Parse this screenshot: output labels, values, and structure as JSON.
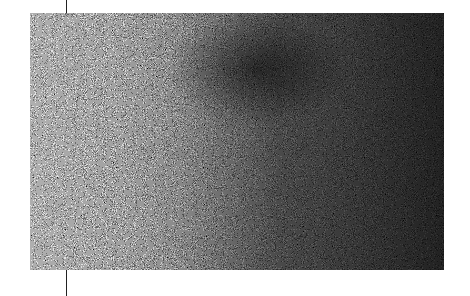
{
  "image": {
    "description": "Grainy monochrome noise texture, lighter on the left and darker on the right, with a darker blob near the upper center; a thin vertical line passes above and below the panel on the left side",
    "colors": {
      "background": "#ffffff",
      "noise_light": "#d9d9d9",
      "noise_dark": "#111111",
      "line": "#222222"
    },
    "panel": {
      "x": 30,
      "y": 13,
      "width": 414,
      "height": 257
    },
    "line_x": 66
  }
}
